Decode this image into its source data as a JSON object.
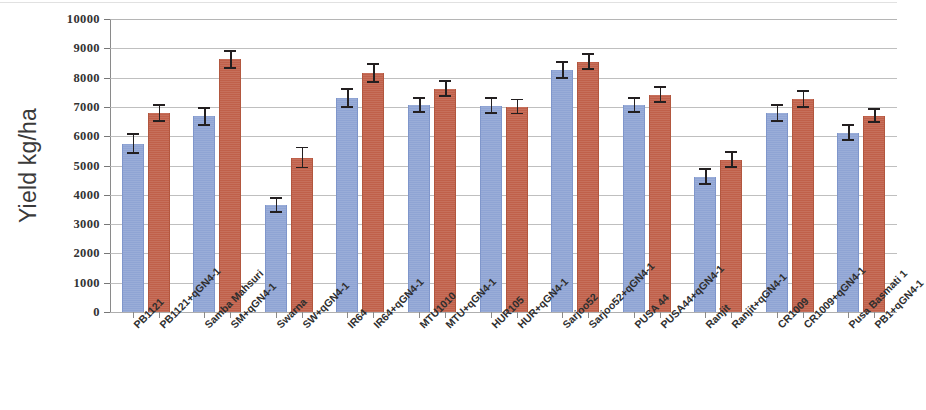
{
  "chart_data": {
    "type": "bar",
    "title": "",
    "xlabel": "",
    "ylabel": "Yield kg/ha",
    "ylim": [
      0,
      10000
    ],
    "ytick_labels": [
      "10000",
      "9000",
      "8000",
      "7000",
      "6000",
      "5000",
      "4000",
      "3000",
      "2000",
      "1000",
      "0"
    ],
    "ytick_values": [
      10000,
      9000,
      8000,
      7000,
      6000,
      5000,
      4000,
      3000,
      2000,
      1000,
      0
    ],
    "grid": true,
    "legend": "none",
    "orientation": "vertical",
    "error_bars": true,
    "categories": [
      "PB1121",
      "PB1121+qGN4-1",
      "Samba Mahsuri",
      "SM+qGN4-1",
      "Swarna",
      "SW+qGN4-1",
      "IR64",
      "IR64+qGN4-1",
      "MTU1010",
      "MTU+qGN4-1",
      "HUR105",
      "HUR+qGN4-1",
      "Sarjoo52",
      "Sarjoo52+qGN4-1",
      "PUSA 44",
      "PUSA44+qGN4-1",
      "Ranjit",
      "Ranjit+qGN4-1",
      "CR1009",
      "CR1009+qGN4-1",
      "Pusa Basmati 1",
      "PB1+qGN4-1"
    ],
    "values": [
      5750,
      6780,
      6680,
      8620,
      3660,
      5270,
      7300,
      8160,
      7060,
      7620,
      7040,
      7010,
      8250,
      8550,
      7060,
      7420,
      4620,
      5200,
      6790,
      7270,
      6120,
      6700
    ],
    "errors": [
      330,
      270,
      290,
      290,
      240,
      340,
      310,
      310,
      250,
      250,
      250,
      240,
      280,
      260,
      250,
      250,
      260,
      260,
      280,
      270,
      250,
      230
    ],
    "series_group": [
      "control",
      "transgenic",
      "control",
      "transgenic",
      "control",
      "transgenic",
      "control",
      "transgenic",
      "control",
      "transgenic",
      "control",
      "transgenic",
      "control",
      "transgenic",
      "control",
      "transgenic",
      "control",
      "transgenic",
      "control",
      "transgenic",
      "control",
      "transgenic"
    ],
    "colors": {
      "control": "#8fa4d4",
      "transgenic": "#c0604a",
      "error_bar": "#231f20",
      "gridline": "#b4b4b4",
      "axis": "#8a8a8a",
      "text": "#333333"
    }
  }
}
